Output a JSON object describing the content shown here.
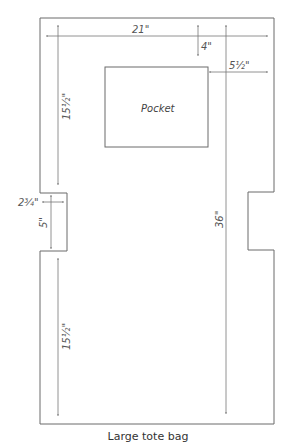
{
  "diagram": {
    "caption": "Large tote bag",
    "pocket_label": "Pocket",
    "dimensions": {
      "width": "21\"",
      "pocket_top_offset": "4\"",
      "pocket_right_offset": "5½\"",
      "upper_side_height": "15½\"",
      "notch_depth": "2¾\"",
      "notch_height": "5\"",
      "lower_side_height": "15½\"",
      "total_height": "36\""
    },
    "colors": {
      "outline": "#6b6b6b",
      "dimension_line": "#777777",
      "text": "#555555"
    }
  }
}
